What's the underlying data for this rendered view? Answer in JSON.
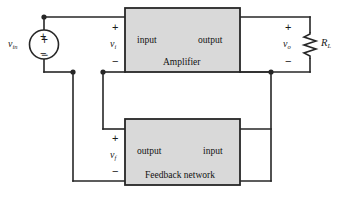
{
  "diagram": {
    "stroke_color": "#262626",
    "block_fill": "#d9d9d9",
    "background": "#ffffff"
  },
  "source": {
    "name": "independent-voltage-source",
    "label_var": "v",
    "label_sub": "in",
    "plus": "+",
    "minus": "−"
  },
  "input_port": {
    "label_var": "v",
    "label_sub": "i",
    "plus": "+",
    "minus": "−"
  },
  "output_port": {
    "label_var": "v",
    "label_sub": "o",
    "plus": "+",
    "minus": "−"
  },
  "feedback_port": {
    "label_var": "v",
    "label_sub": "f",
    "plus": "+",
    "minus": "−"
  },
  "amplifier_block": {
    "name": "Amplifier",
    "caption": "Amplifier",
    "left_port_label": "input",
    "right_port_label": "output"
  },
  "feedback_block": {
    "name": "Feedback network",
    "caption": "Feedback network",
    "left_port_label": "output",
    "right_port_label": "input"
  },
  "load": {
    "label_var": "R",
    "label_sub": "L"
  }
}
